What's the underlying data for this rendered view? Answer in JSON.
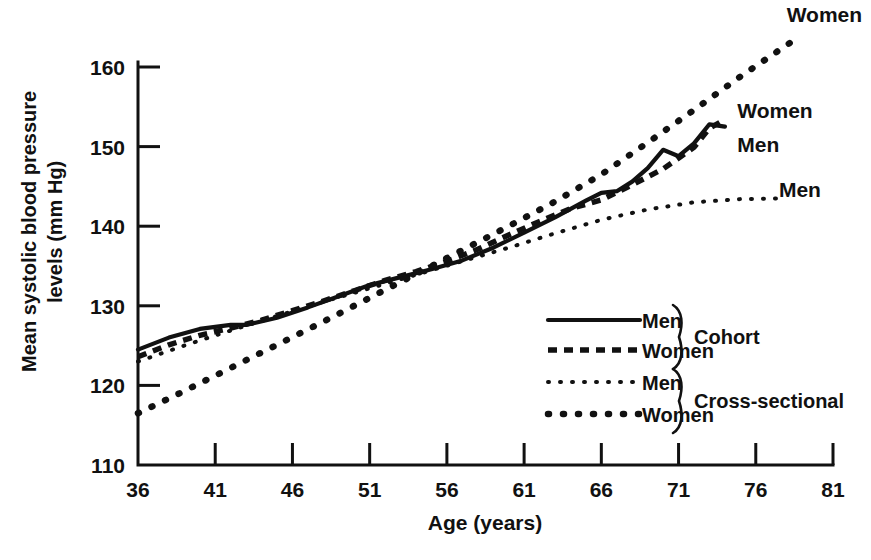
{
  "chart_data": {
    "type": "line",
    "title": "",
    "xlabel": "Age (years)",
    "ylabel": "Mean systolic blood pressure levels (mm Hg)",
    "ylabel_line1": "Mean systolic blood pressure",
    "ylabel_line2": "levels (mm Hg)",
    "xlim": [
      36,
      81
    ],
    "ylim": [
      110,
      165
    ],
    "xticks": [
      36,
      41,
      46,
      51,
      56,
      61,
      66,
      71,
      76,
      81
    ],
    "yticks": [
      110,
      120,
      130,
      140,
      150,
      160
    ],
    "grid": false,
    "legend_position": "inside-lower-right",
    "series": [
      {
        "name": "Men",
        "group": "Cohort",
        "style": "solid",
        "x": [
          36,
          38,
          40,
          42,
          43,
          45,
          47,
          49,
          51,
          53,
          55,
          57,
          59,
          61,
          63,
          65,
          66,
          67,
          68,
          69,
          70,
          71,
          72,
          73,
          74
        ],
        "values": [
          124.5,
          126.0,
          127.1,
          127.6,
          127.6,
          128.5,
          129.8,
          131.2,
          132.6,
          133.6,
          134.6,
          135.7,
          137.3,
          139.2,
          141.1,
          143.2,
          144.2,
          144.4,
          145.6,
          147.3,
          149.6,
          148.8,
          150.4,
          152.8,
          152.5
        ]
      },
      {
        "name": "Women",
        "group": "Cohort",
        "style": "thick-dashed",
        "x": [
          36,
          38,
          40,
          42,
          44,
          46,
          48,
          50,
          52,
          54,
          56,
          58,
          60,
          62,
          64,
          66,
          68,
          70,
          72,
          73,
          74
        ],
        "values": [
          123.6,
          125.1,
          126.3,
          127.2,
          128.2,
          129.4,
          130.6,
          131.9,
          133.2,
          134.3,
          135.6,
          137.1,
          138.9,
          140.6,
          142.2,
          143.3,
          145.2,
          147.2,
          149.9,
          152.3,
          153.4
        ]
      },
      {
        "name": "Men",
        "group": "Cross-sectional",
        "style": "fine-dotted",
        "x": [
          36,
          39,
          42,
          45,
          48,
          51,
          54,
          57,
          60,
          63,
          66,
          69,
          72,
          75,
          78
        ],
        "values": [
          123.0,
          125.0,
          126.9,
          128.7,
          130.5,
          132.2,
          133.9,
          135.6,
          137.3,
          139.1,
          140.8,
          142.1,
          143.0,
          143.4,
          143.5
        ]
      },
      {
        "name": "Women",
        "group": "Cross-sectional",
        "style": "bold-dotted",
        "x": [
          36,
          39,
          42,
          45,
          48,
          51,
          54,
          57,
          60,
          63,
          66,
          69,
          72,
          75,
          78.5
        ],
        "values": [
          116.5,
          119.3,
          122.2,
          125.1,
          128.0,
          131.0,
          134.0,
          137.0,
          140.0,
          143.1,
          146.5,
          150.5,
          154.6,
          158.8,
          163.4
        ]
      }
    ],
    "annotations": [
      {
        "id": "annot-cross-women",
        "text": "Women",
        "x": 78.0,
        "y": 166.5
      },
      {
        "id": "annot-cohort-women",
        "text": "Women",
        "x": 74.8,
        "y": 154.5
      },
      {
        "id": "annot-cohort-men",
        "text": "Men",
        "x": 74.8,
        "y": 150.2
      },
      {
        "id": "annot-cross-men",
        "text": "Men",
        "x": 77.5,
        "y": 144.5
      }
    ]
  },
  "legend": {
    "entries": [
      {
        "label": "Men",
        "style": "solid"
      },
      {
        "label": "Women",
        "style": "thick-dashed"
      },
      {
        "label": "Men",
        "style": "fine-dotted"
      },
      {
        "label": "Women",
        "style": "bold-dotted"
      }
    ],
    "groups": [
      {
        "label": "Cohort"
      },
      {
        "label": "Cross-sectional"
      }
    ]
  },
  "style": {
    "ink": "#111111",
    "background": "#ffffff"
  }
}
